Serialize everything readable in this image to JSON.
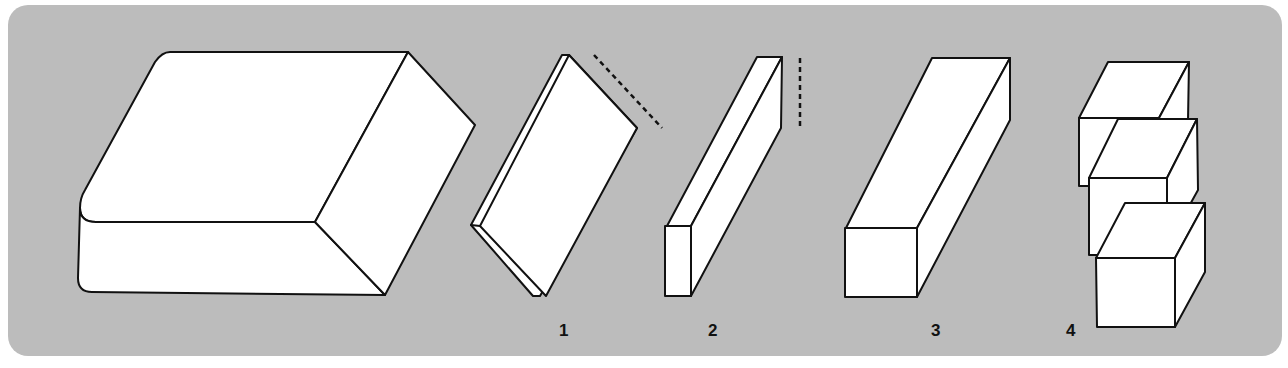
{
  "figure": {
    "background_color": "#bcbcbc",
    "panel_color": "#bcbcbc",
    "line_color": "#111111",
    "fill_color": "#ffffff"
  },
  "shapes": [
    {
      "id": "source-block",
      "label": "",
      "description": "Large rectangular slab (original block)"
    },
    {
      "id": "shape-1",
      "label": "1",
      "description": "Thin flat plate with dashed cut line along top edge"
    },
    {
      "id": "shape-2",
      "label": "2",
      "description": "Long thin beam with vertical dashed cut line"
    },
    {
      "id": "shape-3",
      "label": "3",
      "description": "Long square-section bar"
    },
    {
      "id": "shape-4",
      "label": "4",
      "description": "Three stacked cubes"
    }
  ]
}
